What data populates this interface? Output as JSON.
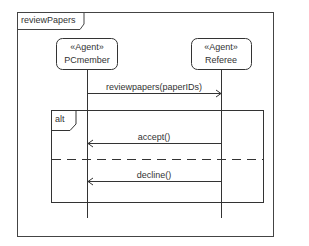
{
  "diagram": {
    "type": "sequence",
    "frame": {
      "label": "reviewPapers"
    },
    "lifelines": [
      {
        "id": "pcmember",
        "stereotype": "«Agent»",
        "name": "PCmember"
      },
      {
        "id": "referee",
        "stereotype": "«Agent»",
        "name": "Referee"
      }
    ],
    "messages": [
      {
        "label": "reviewpapers(paperIDs)",
        "from": "PCmember",
        "to": "Referee"
      },
      {
        "label": "accept()",
        "from": "Referee",
        "to": "PCmember"
      },
      {
        "label": "decline()",
        "from": "Referee",
        "to": "PCmember"
      }
    ],
    "fragment": {
      "operator": "alt"
    }
  }
}
